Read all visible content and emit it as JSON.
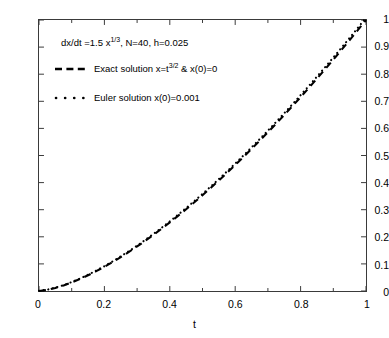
{
  "figure": {
    "background_color": "#ffffff",
    "axes_color": "#3a3a3a",
    "curve_color": "#000000"
  },
  "annotation": {
    "equation_prefix": "dx/dt =1.5 x",
    "equation_exponent": "1/3",
    "equation_suffix": ", N=40, h=0.025"
  },
  "legend": {
    "exact_prefix": "Exact solution x=t",
    "exact_exponent": "3/2",
    "exact_suffix": " & x(0)=0",
    "euler_label": "Euler solution x(0)=0.001"
  },
  "chart_data": {
    "type": "line",
    "title": "",
    "xlabel": "t",
    "ylabel": "",
    "xlim": [
      0,
      1
    ],
    "ylim": [
      0,
      1
    ],
    "grid": false,
    "legend_position": "upper-left-inside",
    "xticks": [
      "0",
      "0.2",
      "0.4",
      "0.6",
      "0.8",
      "1"
    ],
    "xtick_values": [
      0,
      0.2,
      0.4,
      0.6,
      0.8,
      1
    ],
    "yticks": [
      "0",
      "0.1",
      "0.2",
      "0.3",
      "0.4",
      "0.5",
      "0.6",
      "0.7",
      "0.8",
      "0.9",
      "1"
    ],
    "ytick_values": [
      0,
      0.1,
      0.2,
      0.3,
      0.4,
      0.5,
      0.6,
      0.7,
      0.8,
      0.9,
      1
    ],
    "xminor_values": [
      0.1,
      0.3,
      0.5,
      0.7,
      0.9
    ],
    "annotations": [
      "dx/dt =1.5 x^(1/3), N=40, h=0.025"
    ],
    "series": [
      {
        "name": "Exact solution x=t^(3/2) & x(0)=0",
        "linestyle": "dashed",
        "color": "#000000",
        "x": [
          0,
          0.025,
          0.05,
          0.075,
          0.1,
          0.125,
          0.15,
          0.175,
          0.2,
          0.225,
          0.25,
          0.275,
          0.3,
          0.325,
          0.35,
          0.375,
          0.4,
          0.425,
          0.45,
          0.475,
          0.5,
          0.525,
          0.55,
          0.575,
          0.6,
          0.625,
          0.65,
          0.675,
          0.7,
          0.725,
          0.75,
          0.775,
          0.8,
          0.825,
          0.85,
          0.875,
          0.9,
          0.925,
          0.95,
          0.975,
          1
        ],
        "y": [
          0,
          0.00395,
          0.01118,
          0.02054,
          0.03162,
          0.04419,
          0.05809,
          0.07319,
          0.08944,
          0.10674,
          0.125,
          0.14421,
          0.16432,
          0.18528,
          0.20706,
          0.22964,
          0.25298,
          0.27707,
          0.30187,
          0.32738,
          0.35355,
          0.38039,
          0.40788,
          0.43599,
          0.46476,
          0.49411,
          0.52404,
          0.55455,
          0.58566,
          0.61726,
          0.64952,
          0.68223,
          0.71554,
          0.74932,
          0.78363,
          0.81845,
          0.85381,
          0.88966,
          0.926,
          0.96284,
          1
        ]
      },
      {
        "name": "Euler solution x(0)=0.001",
        "linestyle": "dotted",
        "color": "#000000",
        "x": [
          0,
          0.025,
          0.05,
          0.075,
          0.1,
          0.125,
          0.15,
          0.175,
          0.2,
          0.225,
          0.25,
          0.275,
          0.3,
          0.325,
          0.35,
          0.375,
          0.4,
          0.425,
          0.45,
          0.475,
          0.5,
          0.525,
          0.55,
          0.575,
          0.6,
          0.625,
          0.65,
          0.675,
          0.7,
          0.725,
          0.75,
          0.775,
          0.8,
          0.825,
          0.85,
          0.875,
          0.9,
          0.925,
          0.95,
          0.975,
          1
        ],
        "y": [
          0.001,
          0.00475,
          0.01204,
          0.02164,
          0.03296,
          0.04576,
          0.05988,
          0.07521,
          0.09167,
          0.10918,
          0.12767,
          0.14709,
          0.16741,
          0.18858,
          0.21057,
          0.23335,
          0.2569,
          0.28119,
          0.3062,
          0.33191,
          0.35829,
          0.38534,
          0.41303,
          0.44135,
          0.47029,
          0.49983,
          0.52996,
          0.56067,
          0.59195,
          0.62379,
          0.65618,
          0.68911,
          0.72258,
          0.75657,
          0.79108,
          0.8261,
          0.86163,
          0.89766,
          0.93418,
          0.97119,
          1.00868
        ]
      }
    ]
  }
}
